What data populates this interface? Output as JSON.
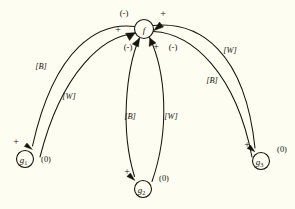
{
  "diagram": {
    "background_color": "#fdfdf2",
    "ink_color": "#16160f",
    "nodes": [
      {
        "id": "f",
        "label": "f",
        "sub": "",
        "cx": 144,
        "cy": 29,
        "r": 9.5,
        "value": ""
      },
      {
        "id": "g1",
        "label": "g",
        "sub": "1",
        "cx": 25,
        "cy": 159,
        "r": 8.5,
        "value": "(0)"
      },
      {
        "id": "g2",
        "label": "g",
        "sub": "2",
        "cx": 143,
        "cy": 189,
        "r": 8.5,
        "value": "(0)"
      },
      {
        "id": "g3",
        "label": "g",
        "sub": "3",
        "cx": 261,
        "cy": 161,
        "r": 8.5,
        "value": "(0)"
      }
    ],
    "node_values": [
      {
        "for": "g1",
        "text": "(0)",
        "x": 46,
        "y": 159
      },
      {
        "for": "g2",
        "text": "(0)",
        "x": 164,
        "y": 178
      },
      {
        "for": "g3",
        "text": "(0)",
        "x": 282,
        "y": 149
      }
    ],
    "edges": [
      {
        "id": "f-g1-B",
        "from": "f",
        "to": "g1",
        "label": "[B]",
        "label_x": 41,
        "label_y": 66,
        "sign_at_source": "(-)",
        "sign_at_target": "+"
      },
      {
        "id": "g1-f-W",
        "from": "g1",
        "to": "f",
        "label": "[W]",
        "label_x": 69,
        "label_y": 96,
        "sign_at_source": "",
        "sign_at_target": "+"
      },
      {
        "id": "f-g2-B",
        "from": "f",
        "to": "g2",
        "label": "[B]",
        "label_x": 130,
        "label_y": 116,
        "sign_at_source": "(-)",
        "sign_at_target": "+"
      },
      {
        "id": "g2-f-W",
        "from": "g2",
        "to": "f",
        "label": "[W]",
        "label_x": 171,
        "label_y": 116,
        "sign_at_source": "",
        "sign_at_target": "+"
      },
      {
        "id": "f-g3-W",
        "from": "f",
        "to": "g3",
        "label": "[W]",
        "label_x": 230,
        "label_y": 50,
        "sign_at_source": "+",
        "sign_at_target": "+"
      },
      {
        "id": "g3-f-B",
        "from": "g3",
        "to": "f",
        "label": "[B]",
        "label_x": 212,
        "label_y": 80,
        "sign_at_source": "",
        "sign_at_target": "(-)"
      }
    ],
    "sign_annotations": [
      {
        "id": "sign-f-upper-left",
        "text": "(-)",
        "x": 124,
        "y": 13
      },
      {
        "id": "sign-f-upper-right",
        "text": "+",
        "x": 163,
        "y": 13
      },
      {
        "id": "sign-f-left",
        "text": "+",
        "x": 118,
        "y": 29
      },
      {
        "id": "sign-f-lower-left",
        "text": "(-)",
        "x": 128,
        "y": 47
      },
      {
        "id": "sign-f-lower-mid",
        "text": "+",
        "x": 156,
        "y": 46
      },
      {
        "id": "sign-f-lower-right",
        "text": "(-)",
        "x": 173,
        "y": 47
      },
      {
        "id": "sign-g1-arrow",
        "text": "+",
        "x": 16,
        "y": 141
      },
      {
        "id": "sign-g2-arrow",
        "text": "+",
        "x": 127,
        "y": 171
      },
      {
        "id": "sign-g3-arrow",
        "text": "+",
        "x": 247,
        "y": 144
      }
    ],
    "edge_labels": [
      {
        "id": "label-left-outer",
        "text": "[B]"
      },
      {
        "id": "label-left-inner",
        "text": "[W]"
      },
      {
        "id": "label-mid-left",
        "text": "[B]"
      },
      {
        "id": "label-mid-right",
        "text": "[W]"
      },
      {
        "id": "label-right-outer",
        "text": "[W]"
      },
      {
        "id": "label-right-inner",
        "text": "[B]"
      }
    ]
  }
}
